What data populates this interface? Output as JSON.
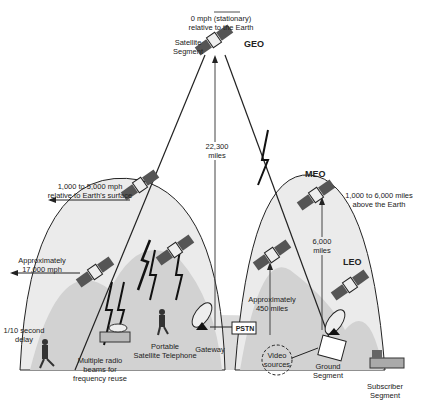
{
  "diagram": {
    "type": "satellite-orbit-segments",
    "orbits": [
      {
        "name": "GEO",
        "label": "GEO",
        "altitude": "22,300 miles",
        "speed": "0 mph (stationary) relative to the Earth"
      },
      {
        "name": "MEO",
        "label": "MEO",
        "altitude": "6,000 miles",
        "range": "1,000 to 6,000 miles above the Earth",
        "speed": "1,000 to 5,000 mph relative to Earth's surface"
      },
      {
        "name": "LEO",
        "label": "LEO",
        "altitude": "Approximately 450 miles",
        "speed": "Approximately 17,000 mph"
      }
    ]
  },
  "labels": {
    "geo_speed_line1": "0 mph (stationary)",
    "geo_speed_line2": "relative to the Earth",
    "satellite_segment_line1": "Satellite",
    "satellite_segment_line2": "Segment",
    "geo": "GEO",
    "geo_altitude_line1": "22,300",
    "geo_altitude_line2": "miles",
    "meo_speed_line1": "1,000 to 5,000 mph",
    "meo_speed_line2": "relative to Earth's surface",
    "meo": "MEO",
    "meo_range_line1": "1,000 to 6,000 miles",
    "meo_range_line2": "above the Earth",
    "meo_altitude_line1": "6,000",
    "meo_altitude_line2": "miles",
    "leo": "LEO",
    "leo_speed_line1": "Approximately",
    "leo_speed_line2": "17,000 mph",
    "leo_altitude_line1": "Approximately",
    "leo_altitude_line2": "450 miles",
    "delay_line1": "1/10 second",
    "delay_line2": "delay",
    "portable_line1": "Portable",
    "portable_line2": "Satellite Telephone",
    "beams_line1": "Multiple radio",
    "beams_line2": "beams for",
    "beams_line3": "frequency reuse",
    "pstn": "PSTN",
    "gateway": "Gateway",
    "video_line1": "Video",
    "video_line2": "sources",
    "ground_line1": "Ground",
    "ground_line2": "Segment",
    "subscriber_line1": "Subscriber",
    "subscriber_line2": "Segment"
  },
  "colors": {
    "ground": "#d9d9d9",
    "orbit_fill": "#e6e6e6",
    "leo_fill": "#cfcfcf",
    "line": "#222222"
  }
}
